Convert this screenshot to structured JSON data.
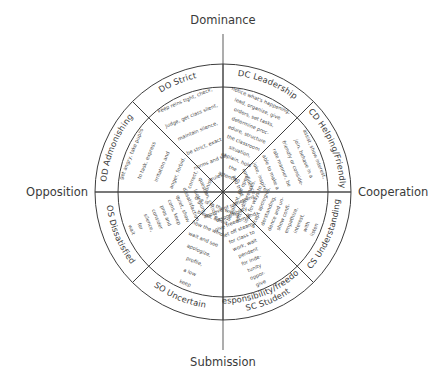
{
  "diagram": {
    "title_top": "Dominance",
    "title_bottom": "Submission",
    "title_left": "Opposition",
    "title_right": "Cooperation",
    "colors": {
      "stroke": "#3d3d3d",
      "axis": "#6a6a6a",
      "text": "#3a3a3a",
      "desc_text": "#4a4a4a",
      "background": "#ffffff"
    },
    "geometry": {
      "center_x": 223,
      "center_y": 192,
      "outer_radius": 128,
      "inner_radius": 105,
      "sector_count": 8
    },
    "sectors": [
      {
        "code": "DC",
        "label": "DC Leadership",
        "label_line1": "DC Leadership",
        "label_line2": "",
        "start_angle": -90,
        "end_angle": -45,
        "description": "notice what's happening, lead, organize, give orders, set tasks, determine proc-edure, structure the classroom situation, explain, hold attention",
        "description_lines": [
          "notice what's happening,",
          "lead, organize, give",
          "orders, set tasks,",
          "determine proc-",
          "edure, structure",
          "the classroom",
          "situation,",
          "explain, hold",
          "the",
          "attention"
        ]
      },
      {
        "code": "CD",
        "label": "CD Helping/Friendly",
        "label_line1": "CD Helping/Friendly",
        "label_line2": "",
        "start_angle": -45,
        "end_angle": 0,
        "description": "assist, show interest, join, behave in a friendly or considerate manner, be able to make a joke, inspire confidence and trust",
        "description_lines": [
          "assist, show interest,",
          "join, behave in a",
          "friendly or conside-",
          "rate manner, be",
          "able to make a",
          "joke, inspire",
          "confidence",
          "and trust"
        ]
      },
      {
        "code": "CS",
        "label": "CS Understanding",
        "label_line1": "CS Understanding",
        "label_line2": "",
        "start_angle": 0,
        "end_angle": 45,
        "description": "listen with interest, empathize, show confidence and understanding, accept apologies, look for ways to settle differences, be patient, be open",
        "description_lines": [
          "listen",
          "with",
          "interest,",
          "empathize,",
          "show confi-",
          "dence and un-",
          "derstanding,",
          "accept apologies,",
          "look for ways to",
          "settle differences,",
          "be patient, be open"
        ]
      },
      {
        "code": "SC",
        "label": "SC Student responsibility/freedom",
        "label_line1": "SC Student",
        "label_line2": "responsibility/freedom",
        "start_angle": 45,
        "end_angle": 90,
        "description": "give oppor-tunity for inde-pendent work, wait for class to let off steam, give freedom and responsibility, approve of something",
        "description_lines": [
          "give",
          "oppor-",
          "tunity",
          "for inde-",
          "pendent",
          "work, wait",
          "for class to",
          "let off steam,",
          "give freedom and",
          "responsibility,",
          "approve of something"
        ]
      },
      {
        "code": "SO",
        "label": "SO Uncertain",
        "label_line1": "SO Uncertain",
        "label_line2": "",
        "start_angle": 90,
        "end_angle": 135,
        "description": "keep a low profile, apologize, wait and see how the wind blows, admit one is in the wrong",
        "description_lines": [
          "keep",
          "a low",
          "profile,",
          "apologize,",
          "wait and see",
          "how the wind",
          "blows, admit",
          "one is in the wrong"
        ]
      },
      {
        "code": "OS",
        "label": "OS Dissatisfied",
        "label_line1": "OS Dissatisfied",
        "label_line2": "",
        "start_angle": 135,
        "end_angle": 180,
        "description": "wait for silence, consider pros and cons, keep quiet, show dissatisfaction, look glum, question, criticize",
        "description_lines": [
          "wait",
          "for",
          "silence,",
          "consider",
          "pros and",
          "cons, keep",
          "quiet, show",
          "dissatisfaction,",
          "look glum,",
          "question, criticize"
        ]
      },
      {
        "code": "OD",
        "label": "OD Admonishing",
        "label_line1": "OD Admonishing",
        "label_line2": "",
        "start_angle": 180,
        "end_angle": 225,
        "description": "get angry, take pupils to task, express irritation and anger, forbid, correct, punish",
        "description_lines": [
          "get angry, take pupils",
          "to task, express",
          "irritation and",
          "anger, forbid,",
          "correct,",
          "punish"
        ]
      },
      {
        "code": "DO",
        "label": "DO Strict",
        "label_line1": "DO Strict",
        "label_line2": "",
        "start_angle": 225,
        "end_angle": 270,
        "description": "keep reins tight, check, judge, get class silent, maintain silence, be strict, exact norms and set rules",
        "description_lines": [
          "keep reins tight, check,",
          "judge, get class silent,",
          "maintain silence,",
          "be strict, exact",
          "norms and set",
          "rules"
        ]
      }
    ]
  }
}
